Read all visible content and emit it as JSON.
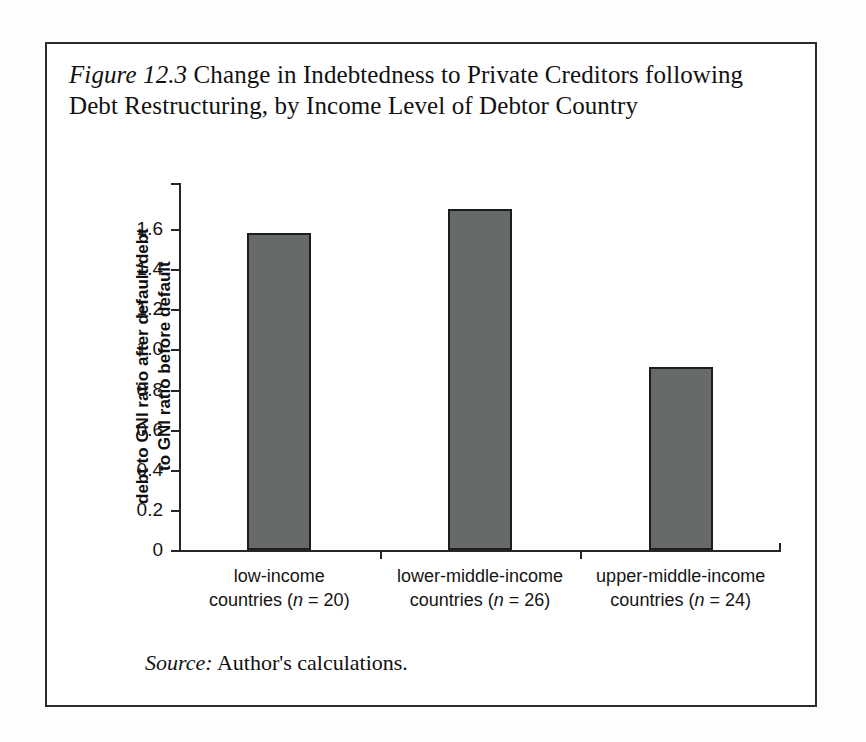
{
  "figure": {
    "label": "Figure 12.3",
    "caption": " Change in Indebtedness to Private Creditors following Debt Restructuring, by Income Level of Debtor Country",
    "source_label": "Source:",
    "source_text": " Author's calculations."
  },
  "colors": {
    "bar_fill": "#666a6a",
    "bar_stroke": "#1d1d1d",
    "axis": "#262626",
    "frame": "#2c2c2c",
    "page_background": "#fdfdfc",
    "text": "#111111"
  },
  "chart_data": {
    "type": "bar",
    "title": "Figure 12.3 Change in Indebtedness to Private Creditors following Debt Restructuring, by Income Level of Debtor Country",
    "categories": [
      "low-income countries (n = 20)",
      "lower-middle-income countries (n = 26)",
      "upper-middle-income countries (n = 24)"
    ],
    "category_lines": [
      [
        "low-income",
        "countries (",
        "n",
        " = 20)"
      ],
      [
        "lower-middle-income",
        "countries (",
        "n",
        " = 26)"
      ],
      [
        "upper-middle-income",
        "countries (",
        "n",
        " = 24)"
      ]
    ],
    "sample_sizes": [
      20,
      26,
      24
    ],
    "values": [
      1.58,
      1.7,
      0.91
    ],
    "xlabel": "",
    "ylabel": "debt to GNI ratio after default/debt to GNI ratio before default",
    "ylabel_line1": "debt to GNI ratio after default/debt",
    "ylabel_line2": "to GNI ratio before default",
    "ylim": [
      0,
      1.84
    ],
    "ytick_values": [
      0,
      0.2,
      0.4,
      0.6,
      0.8,
      1.0,
      1.2,
      1.4,
      1.6
    ],
    "ytick_labels": [
      "0",
      "0.2",
      "0.4",
      "0.6",
      "0.8",
      "1.0",
      "1.2",
      "1.4",
      "1.6"
    ],
    "grid": false,
    "legend": false,
    "source": "Author's calculations."
  }
}
